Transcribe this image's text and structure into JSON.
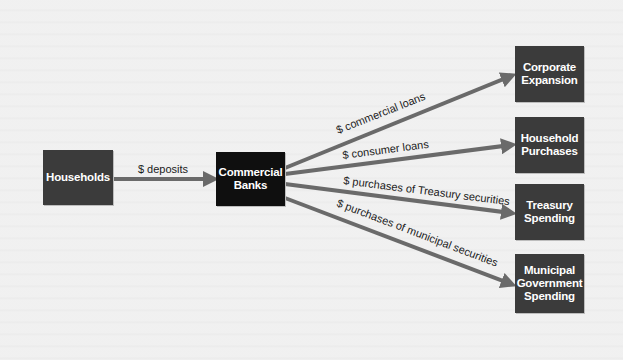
{
  "diagram": {
    "type": "flow",
    "colors": {
      "node_dark": "#3b3b3b",
      "node_center": "#0f0f0f",
      "arrow": "#6a6a6a",
      "label_text": "#1a1a1a",
      "background": "#efefef"
    },
    "nodes": {
      "households": {
        "label": "Households"
      },
      "banks": {
        "label_line1": "Commercial",
        "label_line2": "Banks"
      },
      "corporate": {
        "label_line1": "Corporate",
        "label_line2": "Expansion"
      },
      "household_purchases": {
        "label_line1": "Household",
        "label_line2": "Purchases"
      },
      "treasury": {
        "label_line1": "Treasury",
        "label_line2": "Spending"
      },
      "municipal": {
        "label_line1": "Municipal",
        "label_line2": "Government",
        "label_line3": "Spending"
      }
    },
    "edges": [
      {
        "from": "Households",
        "to": "Commercial Banks",
        "label": "$ deposits"
      },
      {
        "from": "Commercial Banks",
        "to": "Corporate Expansion",
        "label": "$ commercial loans"
      },
      {
        "from": "Commercial Banks",
        "to": "Household Purchases",
        "label": "$ consumer loans"
      },
      {
        "from": "Commercial Banks",
        "to": "Treasury Spending",
        "label": "$ purchases of Treasury securities"
      },
      {
        "from": "Commercial Banks",
        "to": "Municipal Government Spending",
        "label": "$ purchases of municipal securities"
      }
    ]
  }
}
